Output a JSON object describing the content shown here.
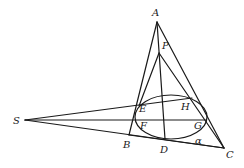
{
  "diagram": {
    "points": {
      "A": {
        "label": "A",
        "x": 157,
        "y": 22,
        "lx": 152,
        "ly": 16
      },
      "P": {
        "label": "P",
        "x": 159,
        "y": 53,
        "lx": 162,
        "ly": 49
      },
      "S": {
        "label": "S",
        "x": 25,
        "y": 120,
        "lx": 13,
        "ly": 124
      },
      "B": {
        "label": "B",
        "x": 129,
        "y": 135,
        "lx": 123,
        "ly": 148
      },
      "D": {
        "label": "D",
        "x": 165,
        "y": 139,
        "lx": 160,
        "ly": 153
      },
      "C": {
        "label": "C",
        "x": 224,
        "y": 148,
        "lx": 226,
        "ly": 158
      },
      "E": {
        "label": "E",
        "x": 139,
        "y": 106,
        "lx": 139,
        "ly": 112
      },
      "F": {
        "label": "F",
        "x": 134,
        "y": 120,
        "lx": 140,
        "ly": 129
      },
      "G": {
        "label": "G",
        "x": 206,
        "y": 120,
        "lx": 194,
        "ly": 129
      },
      "H": {
        "label": "H",
        "x": 192,
        "y": 98,
        "lx": 181,
        "ly": 110
      },
      "alpha": {
        "label": "α",
        "x": 197,
        "y": 141,
        "lx": 195,
        "ly": 144
      }
    },
    "ellipse": {
      "cx": 171,
      "cy": 117,
      "rx": 36,
      "ry": 22
    },
    "segments": [
      [
        "A",
        "B"
      ],
      [
        "A",
        "C"
      ],
      [
        "B",
        "C"
      ],
      [
        "A",
        "D"
      ],
      [
        "P",
        "E"
      ],
      [
        "P",
        "C"
      ],
      [
        "S",
        "H"
      ],
      [
        "S",
        "G"
      ],
      [
        "S",
        "C"
      ]
    ]
  }
}
